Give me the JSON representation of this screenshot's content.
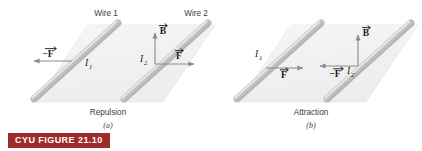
{
  "figure": {
    "badge_label": "CYU FIGURE 21.10",
    "badge_color": "#9e2a2a",
    "badge_text_color": "#ffffff",
    "plane_color": "#f2f2f2",
    "wire_color": "#b8b8b8",
    "arrow_color": "#8c8c8c"
  },
  "panels": [
    {
      "id": "panel-a",
      "letter": "(a)",
      "caption": "Repulsion",
      "wire_labels": [
        {
          "name": "Wire 1"
        },
        {
          "name": "Wire 2"
        }
      ],
      "currents": [
        {
          "symbol": "I",
          "subscript": "1"
        },
        {
          "symbol": "I",
          "subscript": "2"
        }
      ],
      "vectors": [
        {
          "label": "-F",
          "symbol": "F",
          "sign": "−",
          "direction": "left"
        },
        {
          "label": "B",
          "symbol": "B",
          "sign": "",
          "direction": "up"
        },
        {
          "label": "F",
          "symbol": "F",
          "sign": "",
          "direction": "right"
        }
      ]
    },
    {
      "id": "panel-b",
      "letter": "(b)",
      "caption": "Attraction",
      "wire_labels": [],
      "currents": [
        {
          "symbol": "I",
          "subscript": "1"
        },
        {
          "symbol": "I",
          "subscript": "2"
        }
      ],
      "vectors": [
        {
          "label": "F",
          "symbol": "F",
          "sign": "",
          "direction": "right"
        },
        {
          "label": "-F",
          "symbol": "F",
          "sign": "−",
          "direction": "left"
        },
        {
          "label": "B",
          "symbol": "B",
          "sign": "",
          "direction": "up"
        }
      ]
    }
  ]
}
